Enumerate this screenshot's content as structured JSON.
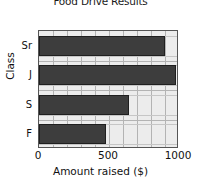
{
  "chart_data": {
    "type": "bar",
    "orientation": "horizontal",
    "title": "Food Drive Results",
    "xlabel": "Amount raised ($)",
    "ylabel": "Class",
    "categories": [
      "Sr",
      "J",
      "S",
      "F"
    ],
    "values": [
      900,
      980,
      645,
      480
    ],
    "xlim": [
      0,
      1000
    ],
    "xticks": [
      0,
      500,
      1000
    ],
    "xtick_labels": [
      "0",
      "500",
      "1000"
    ],
    "minor_gridline_step": 100,
    "grid": true,
    "legend": null,
    "series": [
      {
        "name": "Amount raised",
        "values": [
          900,
          980,
          645,
          480
        ]
      }
    ],
    "colors": {
      "bar_fill": "#3d3d3d",
      "bar_edge": "#1f1f1f",
      "plot_background": "#ececec",
      "gridline": "#b3b3b3",
      "axis": "#555555",
      "text": "#111111",
      "page_background": "#ffffff"
    }
  }
}
